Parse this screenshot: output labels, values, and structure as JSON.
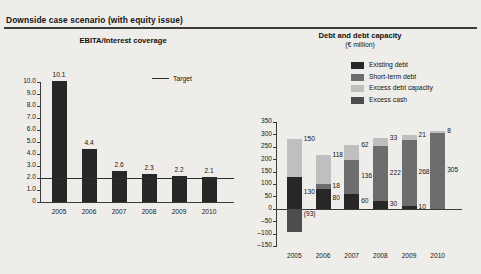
{
  "exhibit": {
    "title": "Downside case scenario (with equity issue)"
  },
  "colors": {
    "existing_debt": "#272727",
    "short_term_debt": "#6d6d6d",
    "excess_debt_capacity": "#bfbfbf",
    "excess_cash": "#4d4d4d",
    "axis": "#3a3a3a",
    "background": "#efedea",
    "target_line": "#2e2e2e"
  },
  "left_panel": {
    "title": "EBITA/Interest coverage",
    "target_legend_label": "Target"
  },
  "right_panel": {
    "title": "Debt and debt capacity",
    "subtitle": "(€ million)",
    "legend": [
      {
        "label": "Existing debt",
        "color_key": "existing_debt"
      },
      {
        "label": "Short-term debt",
        "color_key": "short_term_debt"
      },
      {
        "label": "Excess debt capacity",
        "color_key": "excess_debt_capacity"
      },
      {
        "label": "Excess cash",
        "color_key": "excess_cash"
      }
    ]
  },
  "chart_data": [
    {
      "id": "ebita-interest-coverage",
      "type": "bar",
      "title": "EBITA/Interest coverage",
      "xlabel": "",
      "ylabel": "",
      "categories": [
        "2005",
        "2006",
        "2007",
        "2008",
        "2009",
        "2010"
      ],
      "values": [
        10.1,
        4.4,
        2.6,
        2.3,
        2.2,
        2.1
      ],
      "value_labels": [
        "10.1",
        "4.4",
        "2.6",
        "2.3",
        "2.2",
        "2.1"
      ],
      "ylim": [
        0,
        10
      ],
      "yticks": [
        0,
        1,
        2,
        3,
        4,
        5,
        6,
        7,
        8,
        9,
        10
      ],
      "ytick_labels": [
        "0",
        "1.0",
        "2.0",
        "3.0",
        "4.0",
        "5.0",
        "6.0",
        "7.0",
        "8.0",
        "9.0",
        "10.0"
      ],
      "grid": false,
      "legend_position": "top-right",
      "annotations": [
        {
          "type": "hline",
          "label": "Target",
          "value": 2.0
        }
      ]
    },
    {
      "id": "debt-and-debt-capacity",
      "type": "bar",
      "subtype": "stacked",
      "title": "Debt and debt capacity",
      "subtitle": "(€ million)",
      "xlabel": "",
      "ylabel": "",
      "unit": "€ million",
      "categories": [
        "2005",
        "2006",
        "2007",
        "2008",
        "2009",
        "2010"
      ],
      "series": [
        {
          "name": "Existing debt",
          "values": [
            130,
            80,
            60,
            30,
            10,
            0
          ],
          "labels": [
            "130",
            "80",
            "60",
            "30",
            "10",
            "0"
          ]
        },
        {
          "name": "Short-term debt",
          "values": [
            0,
            18,
            136,
            222,
            268,
            305
          ],
          "labels": [
            "",
            "18",
            "136",
            "222",
            "268",
            "305"
          ]
        },
        {
          "name": "Excess debt capacity",
          "values": [
            150,
            118,
            62,
            33,
            21,
            8
          ],
          "labels": [
            "150",
            "118",
            "62",
            "33",
            "21",
            "8"
          ]
        },
        {
          "name": "Excess cash",
          "values": [
            -93,
            0,
            0,
            0,
            0,
            0
          ],
          "labels": [
            "(93)",
            "",
            "",
            "",
            "",
            ""
          ]
        }
      ],
      "ylim": [
        -150,
        350
      ],
      "yticks": [
        -150,
        -100,
        -50,
        0,
        50,
        100,
        150,
        200,
        250,
        300,
        350
      ],
      "ytick_labels": [
        "–150",
        "–100",
        "–50",
        "0",
        "50",
        "100",
        "150",
        "200",
        "250",
        "300",
        "350"
      ],
      "grid": false,
      "legend_position": "above-plot-right"
    }
  ]
}
